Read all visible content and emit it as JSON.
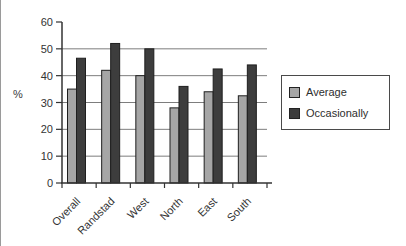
{
  "chart_data": {
    "type": "bar",
    "title": "",
    "categories": [
      "Overall",
      "Randstad",
      "West",
      "North",
      "East",
      "South"
    ],
    "series": [
      {
        "name": "Average",
        "color": "#a6a6a6",
        "values": [
          35,
          42,
          40,
          28,
          34,
          32.5
        ]
      },
      {
        "name": "Occasionally",
        "color": "#3d3d3d",
        "values": [
          46.5,
          52,
          50,
          36,
          42.5,
          44
        ]
      }
    ],
    "xlabel": "",
    "ylabel": "%",
    "ylim": [
      0,
      60
    ],
    "ytick_step": 10,
    "yticks": [
      0,
      10,
      20,
      30,
      40,
      50,
      60
    ],
    "grid": true,
    "legend_position": "right",
    "bar_outline_color": "#1f1f1f",
    "gridline_color": "#7d7d7d",
    "axis_color": "#333333"
  }
}
